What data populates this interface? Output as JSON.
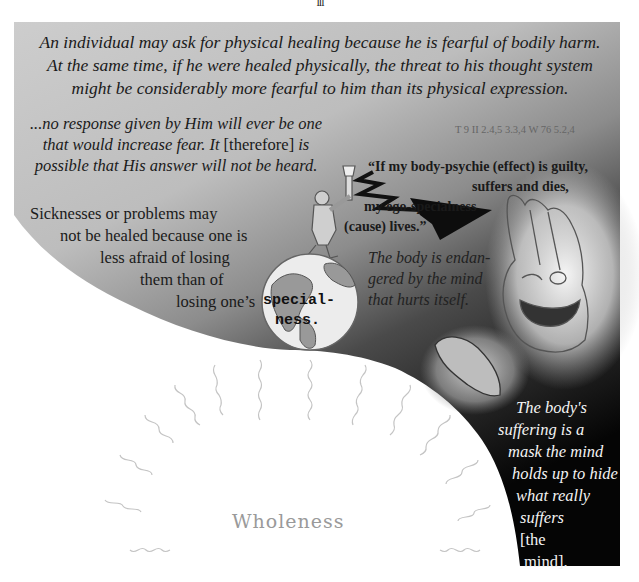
{
  "page": {
    "page_number": "III",
    "top_quote": [
      "An individual may ask for physical healing because he is fearful of bodily harm.",
      "At the same time, if he were healed physically, the threat to his thought system",
      "might be considerably more fearful to him than its physical expression."
    ],
    "response_quote": {
      "line1": "...no response given by Him will ever be one",
      "line2_italic": "that would increase fear. It ",
      "line2_bracket": "[therefore]",
      "line2_end": " is",
      "line3": "possible that His answer will not be heard."
    },
    "reference": "T 9 II 2.4,5 3.3,4    W 76 5.2,4",
    "ego_quote": [
      "“If my body-psychie (effect) is guilty,",
      "suffers and dies,",
      "my ego-specialness",
      "(cause) lives.”"
    ],
    "sickness_text": [
      "Sicknesses or problems may",
      "not be healed because one is",
      "less afraid of losing",
      "them than of",
      "losing one’s"
    ],
    "specialness_label": [
      "special-",
      "ness."
    ],
    "endangered_text": [
      "The body is endan-",
      "gered by the mind",
      "that hurts itself."
    ],
    "mask_text": {
      "lines": [
        "The body's",
        "suffering is a",
        "mask the mind",
        "holds up to hide",
        "what really"
      ],
      "line6_italic": "suffers ",
      "line6_bracket": "[the",
      "line7": "mind]."
    },
    "wholeness_label": "Wholeness",
    "colors": {
      "panel_light": "#c4c4c4",
      "panel_mid": "#8a8a8a",
      "panel_dark": "#0a0a0a",
      "wholeness_text": "#9a9a9a",
      "mask_text": "#f3f3f3"
    },
    "illustrations": [
      "earth-globe",
      "man-with-axe",
      "lightning-bolt-arrow",
      "praying-hands-face",
      "fish-shape",
      "radiating-wavy-rays"
    ]
  }
}
